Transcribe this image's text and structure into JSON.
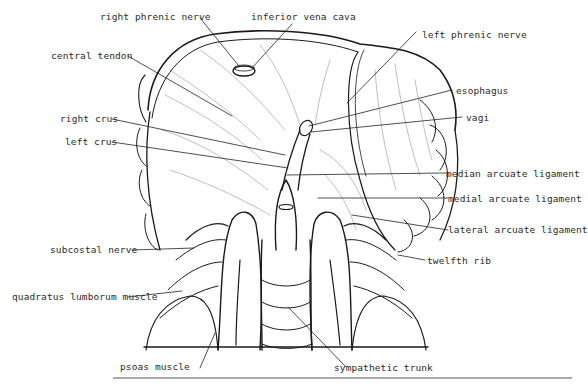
{
  "figure": {
    "labels": {
      "right_phrenic_nerve": "right phrenic nerve",
      "inferior_vena_cava": "inferior vena cava",
      "left_phrenic_nerve": "left phrenic nerve",
      "central_tendon": "central tendon",
      "esophagus": "esophagus",
      "vagi": "vagi",
      "right_crus": "right crus",
      "left_crus": "left crus",
      "median_arcuate_ligament": "median arcuate ligament",
      "medial_arcuate_ligament": "medial arcuate ligament",
      "lateral_arcuate_ligament": "lateral arcuate ligament",
      "subcostal_nerve": "subcostal nerve",
      "twelfth_rib": "twelfth rib",
      "quadratus_lumborum_muscle": "quadratus lumborum muscle",
      "psoas_muscle": "psoas muscle",
      "sympathetic_trunk": "sympathetic trunk"
    },
    "colors": {
      "ink": "#1a1a1a",
      "background": "#ffffff",
      "rule": "#555555"
    }
  }
}
